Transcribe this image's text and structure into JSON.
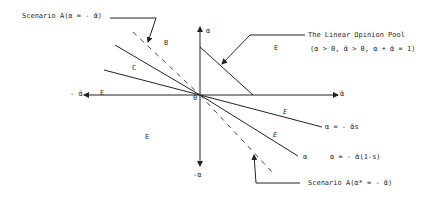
{
  "diagram": {
    "origin_label": "0",
    "axes": {
      "positive_x": "ᾱ",
      "negative_x": "- ᾱ",
      "positive_y": "α",
      "negative_y": "-α"
    },
    "annotations": {
      "scenario_top": "Scenario A(α = - ᾱ)",
      "scenario_bottom": "Scenario A(α* = - ᾱ)",
      "linear_pool_title": "The Linear Opinion Pool",
      "linear_pool_condition": "(α > 0, ᾱ > 0, α + ᾱ = 1)",
      "line_s": "α = - ᾱs",
      "line_1ms_short": "α",
      "line_1ms": "α = - ᾱ(1-s)"
    },
    "regions": {
      "B": "B",
      "C": "C",
      "E_upper_right": "E",
      "E_left_axis": "E",
      "E_lower_left": "E",
      "E_lower_right_1": "E",
      "E_lower_right_2": "E"
    }
  }
}
